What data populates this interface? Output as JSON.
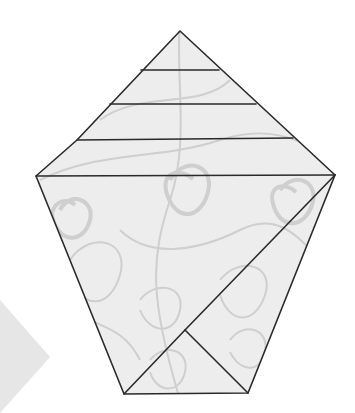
{
  "diagram": {
    "type": "origami-fold-diagram",
    "colors": {
      "background": "#ffffff",
      "paper_fill": "#ededed",
      "paper_fill_light": "#f5f5f5",
      "fold_line": "#2a2a2a",
      "swirl_pattern": "#c4c4c4",
      "arrow_fill": "#e6e6e6"
    },
    "outline_points": "180,31 335,175 248,393 124,394 36,176 77,140",
    "outer_vertices": [
      {
        "name": "top",
        "x": 180,
        "y": 31
      },
      {
        "name": "right",
        "x": 335,
        "y": 175
      },
      {
        "name": "bottom-right",
        "x": 248,
        "y": 393
      },
      {
        "name": "bottom-left",
        "x": 124,
        "y": 394
      },
      {
        "name": "left",
        "x": 36,
        "y": 176
      }
    ],
    "horizontal_folds": [
      {
        "x1": 141,
        "y1": 70,
        "x2": 219,
        "y2": 70
      },
      {
        "x1": 110,
        "y1": 104,
        "x2": 256,
        "y2": 104
      },
      {
        "x1": 77,
        "y1": 140,
        "x2": 293,
        "y2": 138
      },
      {
        "x1": 36,
        "y1": 176,
        "x2": 335,
        "y2": 175
      }
    ],
    "diagonal_folds": [
      {
        "x1": 335,
        "y1": 175,
        "x2": 185,
        "y2": 330
      },
      {
        "x1": 185,
        "y1": 330,
        "x2": 124,
        "y2": 394
      },
      {
        "x1": 185,
        "y1": 330,
        "x2": 248,
        "y2": 393
      }
    ],
    "arrow_points": "0,300 50,357 0,413"
  }
}
